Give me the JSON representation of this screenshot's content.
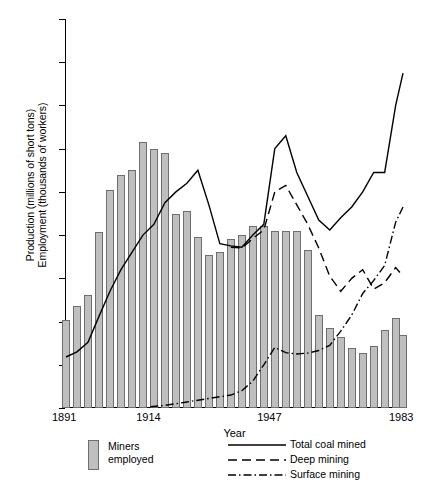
{
  "chart_data": {
    "type": "bar",
    "title": "",
    "xlabel": "Year",
    "ylabel_line1": "Production (millions of short tons)",
    "ylabel_line2": "Employment (thousands of workers)",
    "ylim": [
      0,
      900
    ],
    "yticks": [
      0,
      100,
      200,
      300,
      400,
      500,
      600,
      700,
      800,
      900
    ],
    "ytick_labels": [
      "0",
      "100",
      "200",
      "300",
      "400",
      "500",
      "600",
      "700",
      "800",
      "900"
    ],
    "xlim": [
      1891,
      1983
    ],
    "xticks": [
      1891,
      1914,
      1947,
      1983
    ],
    "xtick_labels": [
      "1891",
      "1914",
      "1947",
      "1983"
    ],
    "grid": false,
    "legend_position": "below-plot",
    "bar_color": "#bfbfbf",
    "bar_edge_color": "#6e6e6e",
    "line_color": "#000000",
    "bars": {
      "name": "Miners employed",
      "x": [
        1891,
        1894,
        1897,
        1900,
        1903,
        1906,
        1909,
        1912,
        1915,
        1918,
        1921,
        1924,
        1927,
        1930,
        1933,
        1936,
        1939,
        1942,
        1945,
        1948,
        1951,
        1954,
        1957,
        1960,
        1963,
        1966,
        1969,
        1972,
        1975,
        1978,
        1981,
        1983
      ],
      "values": [
        203,
        235,
        262,
        408,
        505,
        540,
        550,
        615,
        600,
        590,
        450,
        455,
        395,
        355,
        360,
        390,
        400,
        420,
        420,
        410,
        410,
        410,
        365,
        215,
        185,
        165,
        140,
        128,
        143,
        180,
        208,
        168
      ]
    },
    "series": [
      {
        "name": "Total coal mined",
        "style": "solid",
        "x": [
          1891,
          1894,
          1897,
          1900,
          1903,
          1906,
          1909,
          1912,
          1915,
          1918,
          1921,
          1924,
          1927,
          1930,
          1933,
          1936,
          1939,
          1942,
          1945,
          1948,
          1951,
          1954,
          1957,
          1960,
          1963,
          1966,
          1969,
          1972,
          1975,
          1978,
          1981,
          1983
        ],
        "values": [
          118,
          130,
          152,
          212,
          270,
          320,
          360,
          400,
          425,
          475,
          500,
          520,
          550,
          470,
          380,
          375,
          372,
          400,
          425,
          600,
          630,
          545,
          490,
          435,
          412,
          440,
          465,
          500,
          545,
          545,
          700,
          775
        ]
      },
      {
        "name": "Deep mining",
        "style": "dashed",
        "x": [
          1936,
          1939,
          1942,
          1945,
          1948,
          1951,
          1954,
          1957,
          1960,
          1963,
          1966,
          1969,
          1972,
          1975,
          1978,
          1981,
          1983
        ],
        "values": [
          372,
          370,
          392,
          412,
          500,
          515,
          470,
          425,
          370,
          305,
          270,
          300,
          320,
          275,
          290,
          325,
          305
        ]
      },
      {
        "name": "Surface mining",
        "style": "dash-dot",
        "x": [
          1914,
          1918,
          1921,
          1924,
          1927,
          1930,
          1933,
          1936,
          1939,
          1942,
          1945,
          1948,
          1951,
          1954,
          1957,
          1960,
          1963,
          1966,
          1969,
          1972,
          1975,
          1978,
          1981,
          1983
        ],
        "values": [
          3,
          6,
          10,
          14,
          18,
          22,
          26,
          30,
          40,
          62,
          100,
          140,
          128,
          125,
          127,
          133,
          145,
          178,
          215,
          265,
          295,
          330,
          430,
          465
        ]
      }
    ]
  },
  "legend": {
    "bars_label_line1": "Miners",
    "bars_label_line2": "employed",
    "entries": [
      {
        "label": "Total coal mined"
      },
      {
        "label": "Deep mining"
      },
      {
        "label": "Surface mining"
      }
    ]
  }
}
